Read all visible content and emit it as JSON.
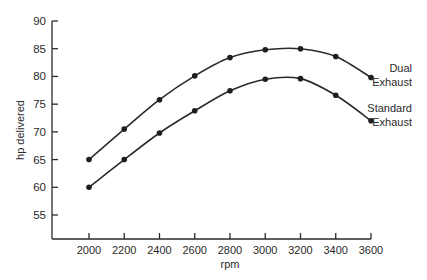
{
  "chart_data": {
    "type": "line",
    "title": "",
    "xlabel": "rpm",
    "ylabel": "hp delivered",
    "x": [
      2000,
      2200,
      2400,
      2600,
      2800,
      3000,
      3200,
      3400,
      3600
    ],
    "x_tick_labels": [
      "2000",
      "2200",
      "2400",
      "2600",
      "2800",
      "3000",
      "3200",
      "3400",
      "3600"
    ],
    "y_ticks": [
      55,
      60,
      65,
      70,
      75,
      80,
      85,
      90
    ],
    "y_tick_labels": [
      "55",
      "60",
      "65",
      "70",
      "75",
      "80",
      "85",
      "90"
    ],
    "xlim": [
      1800,
      3600
    ],
    "ylim": [
      50,
      90
    ],
    "grid": false,
    "legend_position": "inline-right",
    "series": [
      {
        "name": "Dual Exhaust",
        "label_lines": [
          "Dual",
          "Exhaust"
        ],
        "values": [
          65,
          70.5,
          75.8,
          80.1,
          83.4,
          84.8,
          85,
          83.6,
          79.8
        ]
      },
      {
        "name": "Standard Exhaust",
        "label_lines": [
          "Standard",
          "Exhaust"
        ],
        "values": [
          60,
          65,
          69.8,
          73.8,
          77.4,
          79.5,
          79.6,
          76.6,
          72
        ]
      }
    ]
  },
  "colors": {
    "ink": "#2a2a2a",
    "background": "#ffffff"
  }
}
